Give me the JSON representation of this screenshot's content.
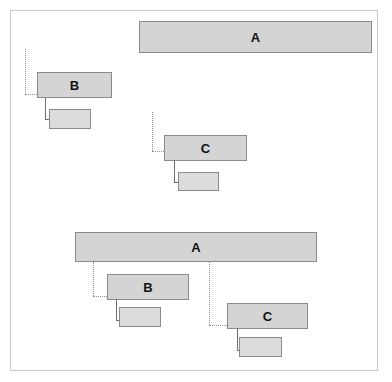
{
  "diagram": {
    "frame": {
      "x": 10,
      "y": 10,
      "width": 368,
      "height": 361,
      "border_color": "#c9c9c9"
    },
    "colors": {
      "block_fill": "#d4d4d4",
      "block_border": "#8a8a8a",
      "subblock_fill": "#dcdcdc",
      "connector_dotted": "#8f8f8f",
      "connector_solid": "#6e6e6e",
      "label_text": "#111111",
      "background": "#ffffff"
    },
    "groups": [
      {
        "name": "upper-group",
        "blocks": [
          {
            "id": "upper-a",
            "label": "A",
            "x": 138,
            "y": 20,
            "width": 233,
            "height": 32
          },
          {
            "id": "upper-b",
            "label": "B",
            "x": 36,
            "y": 71,
            "width": 75,
            "height": 26
          },
          {
            "id": "upper-c",
            "label": "C",
            "x": 163,
            "y": 134,
            "width": 83,
            "height": 26
          }
        ],
        "subblocks": [
          {
            "id": "upper-b-sub",
            "label": "",
            "x": 48,
            "y": 108,
            "width": 42,
            "height": 20
          },
          {
            "id": "upper-c-sub",
            "label": "",
            "x": 177,
            "y": 171,
            "width": 41,
            "height": 19
          }
        ]
      },
      {
        "name": "lower-group",
        "blocks": [
          {
            "id": "lower-a",
            "label": "A",
            "x": 74,
            "y": 231,
            "width": 242,
            "height": 30
          },
          {
            "id": "lower-b",
            "label": "B",
            "x": 106,
            "y": 273,
            "width": 82,
            "height": 26
          },
          {
            "id": "lower-c",
            "label": "C",
            "x": 226,
            "y": 302,
            "width": 81,
            "height": 26
          }
        ],
        "subblocks": [
          {
            "id": "lower-b-sub",
            "label": "",
            "x": 118,
            "y": 306,
            "width": 42,
            "height": 20
          },
          {
            "id": "lower-c-sub",
            "label": "",
            "x": 238,
            "y": 336,
            "width": 43,
            "height": 20
          }
        ]
      }
    ],
    "labels": [
      "A",
      "B",
      "C",
      "A",
      "B",
      "C"
    ]
  }
}
